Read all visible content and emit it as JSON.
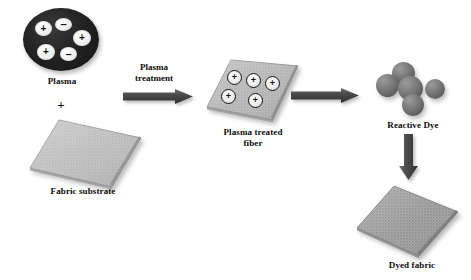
{
  "figure": {
    "type": "process-flow-diagram",
    "background_color": "#ffffff",
    "width": 471,
    "height": 280
  },
  "colors": {
    "plasma_fill": "#1d1d1d",
    "charge_fill": "#f2f2f2",
    "fabric_light": "#b9b9b9",
    "fabric_dark": "#8f8f8f",
    "dye_sphere": "#6f6f6f",
    "arrow_dark": "#4a4a4a",
    "arrow_light": "#8c8c8c",
    "text": "#0c0c0c"
  },
  "stages": {
    "plasma": {
      "label": "Plasma",
      "charges": [
        {
          "sign": "+",
          "name": "positive-charge"
        },
        {
          "sign": "–",
          "name": "negative-charge"
        },
        {
          "sign": "+",
          "name": "positive-charge"
        },
        {
          "sign": "+",
          "name": "positive-charge"
        },
        {
          "sign": "–",
          "name": "negative-charge"
        }
      ],
      "charge_count": 5,
      "positive_count": 3,
      "negative_count": 2
    },
    "combine_symbol": "+",
    "fabric_substrate": {
      "label": "Fabric substrate",
      "shade": "light"
    },
    "plasma_treated_fiber": {
      "label": "Plasma treated\nfiber",
      "label_line1": "Plasma treated",
      "label_line2": "fiber",
      "surface_charges": [
        "+",
        "+",
        "+",
        "+",
        "+"
      ],
      "surface_charge_count": 5
    },
    "reactive_dye": {
      "label": "Reactive Dye",
      "sphere_count": 5
    },
    "dyed_fabric": {
      "label": "Dyed fabric",
      "shade": "dark"
    }
  },
  "arrows": {
    "plasma_treatment": {
      "label": "Plasma\ntreatment",
      "label_line1": "Plasma",
      "label_line2": "treatment",
      "direction": "right"
    },
    "dye_transfer": {
      "label": "",
      "direction": "right"
    },
    "dye_application": {
      "label": "",
      "direction": "down"
    }
  }
}
